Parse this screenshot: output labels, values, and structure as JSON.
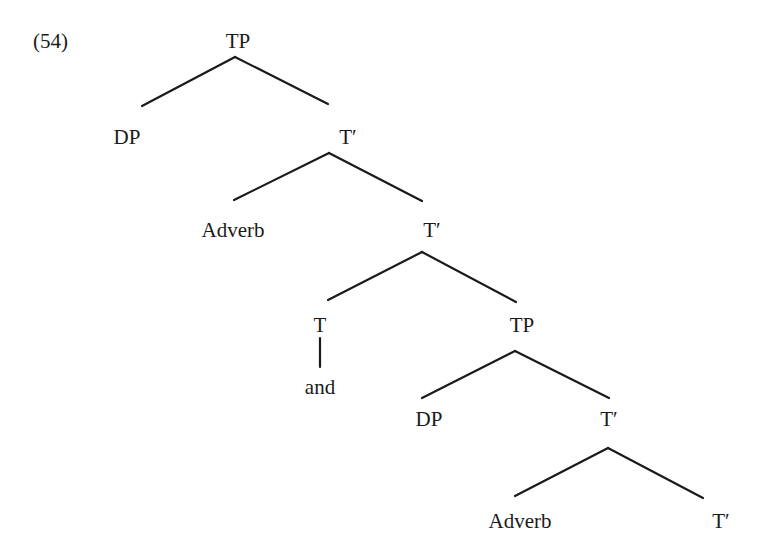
{
  "example_number": "(54)",
  "tree": {
    "nodes": [
      {
        "id": "tp1",
        "label": "TP"
      },
      {
        "id": "dp1",
        "label": "DP"
      },
      {
        "id": "tbar1",
        "label": "T′"
      },
      {
        "id": "adv1",
        "label": "Adverb"
      },
      {
        "id": "tbar2",
        "label": "T′"
      },
      {
        "id": "t1",
        "label": "T"
      },
      {
        "id": "and1",
        "label": "and"
      },
      {
        "id": "tp2",
        "label": "TP"
      },
      {
        "id": "dp2",
        "label": "DP"
      },
      {
        "id": "tbar3",
        "label": "T′"
      },
      {
        "id": "adv2",
        "label": "Adverb"
      },
      {
        "id": "tbar4",
        "label": "T′"
      }
    ],
    "edges": [
      [
        "tp1",
        "dp1"
      ],
      [
        "tp1",
        "tbar1"
      ],
      [
        "tbar1",
        "adv1"
      ],
      [
        "tbar1",
        "tbar2"
      ],
      [
        "tbar2",
        "t1"
      ],
      [
        "tbar2",
        "tp2"
      ],
      [
        "t1",
        "and1"
      ],
      [
        "tp2",
        "dp2"
      ],
      [
        "tp2",
        "tbar3"
      ],
      [
        "tbar3",
        "adv2"
      ],
      [
        "tbar3",
        "tbar4"
      ]
    ]
  }
}
